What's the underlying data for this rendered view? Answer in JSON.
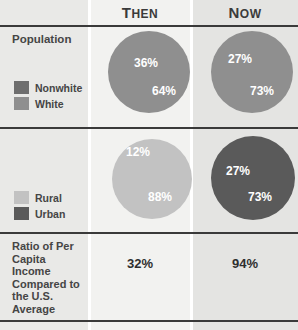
{
  "header": {
    "label_col": "",
    "then": "Then",
    "now": "Now"
  },
  "rows": [
    {
      "title": "Population",
      "legend": [
        {
          "label": "Nonwhite",
          "color": "#6e6e6e"
        },
        {
          "label": "White",
          "color": "#8f8f8f"
        }
      ]
    },
    {
      "title": "",
      "legend": [
        {
          "label": "Rural",
          "color": "#c2c2c2"
        },
        {
          "label": "Urban",
          "color": "#5a5a5a"
        }
      ]
    },
    {
      "title": "Ratio of Per Capita Income Compared to the U.S. Average",
      "then_value": "32%",
      "now_value": "94%"
    }
  ],
  "chart_data": [
    {
      "type": "pie",
      "title": "Population — Then",
      "labels": [
        "Nonwhite",
        "White"
      ],
      "values": [
        36,
        64
      ],
      "value_labels": [
        "36%",
        "64%"
      ],
      "colors": [
        "#6e6e6e",
        "#8f8f8f"
      ],
      "legend": "left-column"
    },
    {
      "type": "pie",
      "title": "Population — Now",
      "labels": [
        "Nonwhite",
        "White"
      ],
      "values": [
        27,
        73
      ],
      "value_labels": [
        "27%",
        "73%"
      ],
      "colors": [
        "#6e6e6e",
        "#8f8f8f"
      ],
      "legend": "left-column"
    },
    {
      "type": "pie",
      "title": "Rural / Urban — Then",
      "labels": [
        "Urban",
        "Rural"
      ],
      "values": [
        12,
        88
      ],
      "value_labels": [
        "12%",
        "88%"
      ],
      "colors": [
        "#5a5a5a",
        "#c2c2c2"
      ],
      "legend": "left-column"
    },
    {
      "type": "pie",
      "title": "Rural / Urban — Now",
      "labels": [
        "Rural",
        "Urban"
      ],
      "values": [
        27,
        73
      ],
      "value_labels": [
        "27%",
        "73%"
      ],
      "colors": [
        "#c2c2c2",
        "#5a5a5a"
      ],
      "legend": "left-column"
    }
  ],
  "pie_labels": {
    "p1_a": "36%",
    "p1_b": "64%",
    "p2_a": "27%",
    "p2_b": "73%",
    "p3_a": "12%",
    "p3_b": "88%",
    "p4_a": "27%",
    "p4_b": "73%"
  },
  "colors": {
    "nonwhite": "#6e6e6e",
    "white": "#8f8f8f",
    "rural": "#c2c2c2",
    "urban": "#5a5a5a",
    "rule": "#3a3a3a",
    "label_band": "#e9e9e7",
    "then_band": "#f2f2f0",
    "now_band": "#e4e4e2"
  }
}
